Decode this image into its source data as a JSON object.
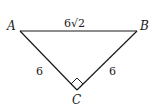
{
  "diagram": {
    "type": "right-triangle",
    "vertices": {
      "A": {
        "label": "A",
        "x": 20,
        "y": 31
      },
      "B": {
        "label": "B",
        "x": 137,
        "y": 31
      },
      "C": {
        "label": "C",
        "x": 77,
        "y": 90
      }
    },
    "sides": {
      "AB": {
        "label": "6√2"
      },
      "AC": {
        "label": "6"
      },
      "BC": {
        "label": "6"
      }
    },
    "right_angle_at": "C",
    "stroke_color": "#1a1a1a"
  }
}
